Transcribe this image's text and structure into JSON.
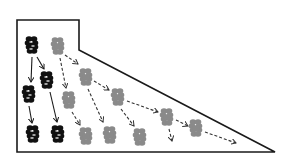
{
  "diagram": {
    "type": "trapezoid-with-diagonal (lineage/flow illustration)",
    "colors": {
      "frame": "#1a1a1a",
      "solid_node": "#111111",
      "faded_node": "#8a8a8a",
      "solid_arrow": "#1a1a1a",
      "dashed_arrow": "#333333",
      "background": "#ffffff"
    },
    "frame_points": [
      [
        17,
        20
      ],
      [
        79,
        20
      ],
      [
        79,
        50
      ],
      [
        275,
        152
      ],
      [
        17,
        152
      ]
    ],
    "solid_nodes": [
      {
        "x": 32,
        "y": 45
      },
      {
        "x": 47,
        "y": 80
      },
      {
        "x": 29,
        "y": 94
      },
      {
        "x": 33,
        "y": 134
      },
      {
        "x": 58,
        "y": 134
      }
    ],
    "faded_nodes": [
      {
        "x": 58,
        "y": 46
      },
      {
        "x": 86,
        "y": 77
      },
      {
        "x": 69,
        "y": 100
      },
      {
        "x": 118,
        "y": 97
      },
      {
        "x": 86,
        "y": 136
      },
      {
        "x": 110,
        "y": 135
      },
      {
        "x": 167,
        "y": 117
      },
      {
        "x": 140,
        "y": 137
      },
      {
        "x": 196,
        "y": 128
      }
    ],
    "solid_arrows": [
      {
        "x1": 32,
        "y1": 57,
        "x2": 31,
        "y2": 82
      },
      {
        "x1": 37,
        "y1": 57,
        "x2": 44,
        "y2": 69
      },
      {
        "x1": 29,
        "y1": 106,
        "x2": 32,
        "y2": 123
      },
      {
        "x1": 50,
        "y1": 92,
        "x2": 57,
        "y2": 122
      }
    ],
    "dashed_arrows": [
      {
        "x1": 60,
        "y1": 58,
        "x2": 66,
        "y2": 88
      },
      {
        "x1": 65,
        "y1": 55,
        "x2": 78,
        "y2": 64
      },
      {
        "x1": 88,
        "y1": 89,
        "x2": 103,
        "y2": 122
      },
      {
        "x1": 94,
        "y1": 81,
        "x2": 109,
        "y2": 90
      },
      {
        "x1": 72,
        "y1": 112,
        "x2": 80,
        "y2": 125
      },
      {
        "x1": 121,
        "y1": 109,
        "x2": 134,
        "y2": 126
      },
      {
        "x1": 127,
        "y1": 101,
        "x2": 158,
        "y2": 112
      },
      {
        "x1": 169,
        "y1": 129,
        "x2": 172,
        "y2": 141
      },
      {
        "x1": 176,
        "y1": 120,
        "x2": 188,
        "y2": 126
      },
      {
        "x1": 205,
        "y1": 132,
        "x2": 236,
        "y2": 143
      }
    ]
  }
}
